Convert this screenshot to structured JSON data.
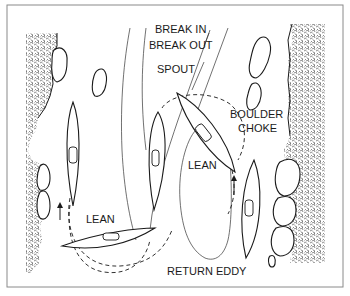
{
  "diagram": {
    "labels": {
      "break_in": "BREAK IN",
      "break_out": "BREAK OUT",
      "spout": "SPOUT",
      "boulder_choke_line1": "BOULDER",
      "boulder_choke_line2": "CHOKE",
      "lean_upper": "LEAN",
      "lean_lower": "LEAN",
      "return_eddy": "RETURN EDDY"
    },
    "elements": {
      "left_bank": "rocky-bank",
      "right_bank": "rocky-bank",
      "kayaks": 5,
      "midstream_boulders": 3,
      "direction_arrows": 2
    },
    "colors": {
      "ink": "#1a1a1a",
      "frame": "#8a8a8a",
      "background": "#ffffff"
    }
  }
}
